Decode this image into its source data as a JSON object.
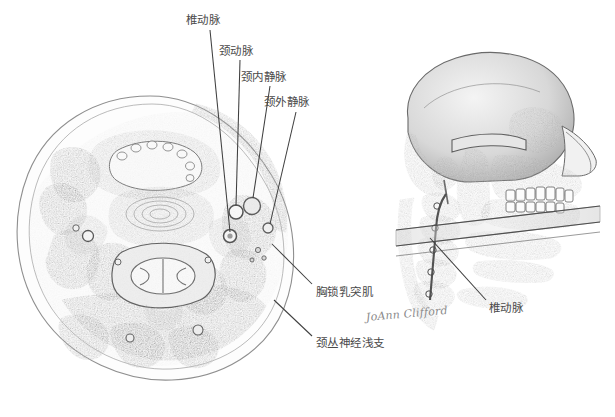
{
  "figure": {
    "background_color": "#ffffff",
    "ink_color": "#4a4a4a",
    "signature": "JoAnn Clifford"
  },
  "labels": [
    {
      "id": "vertebral-artery-top",
      "text": "椎动脉",
      "x": 186,
      "y": 14
    },
    {
      "id": "carotid-artery",
      "text": "颈动脉",
      "x": 219,
      "y": 45
    },
    {
      "id": "internal-jugular-vein",
      "text": "颈内静脉",
      "x": 241,
      "y": 71
    },
    {
      "id": "external-jugular-vein",
      "text": "颈外静脉",
      "x": 264,
      "y": 96
    },
    {
      "id": "sternocleidomastoid",
      "text": "胸锁乳突肌",
      "x": 316,
      "y": 286
    },
    {
      "id": "cervical-plexus-superficial",
      "text": "颈丛神经浅支",
      "x": 316,
      "y": 337
    },
    {
      "id": "vertebral-artery-bottom",
      "text": "椎动脉",
      "x": 489,
      "y": 302
    }
  ],
  "signature_position": {
    "x": 366,
    "y": 311
  },
  "panels": {
    "left": {
      "name": "neck-cross-section",
      "center_x": 155,
      "center_y": 235
    },
    "right": {
      "name": "lateral-skull-cervical-spine",
      "center_x": 465,
      "center_y": 200
    }
  }
}
